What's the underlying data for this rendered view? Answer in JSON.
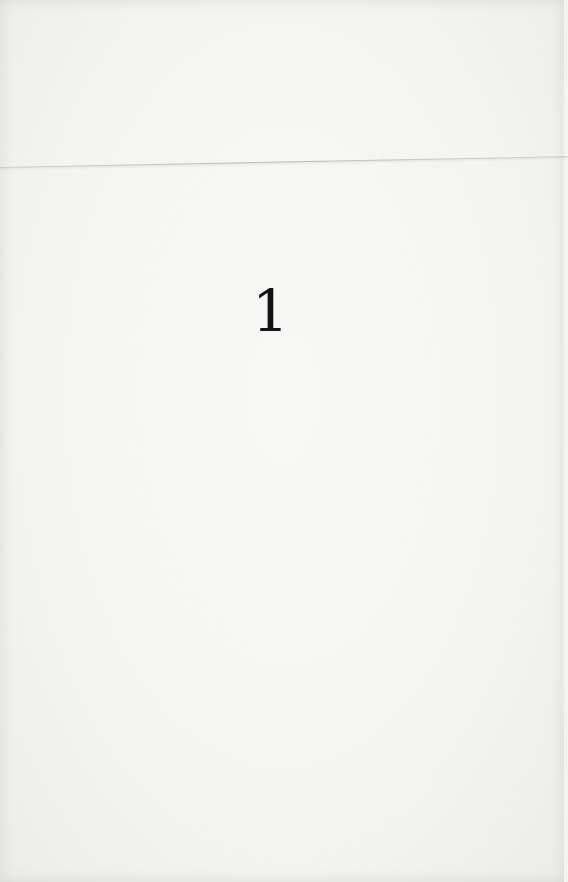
{
  "document": {
    "page_number": "1"
  },
  "colors": {
    "paper": "#f3f3f1",
    "ink": "#141414"
  }
}
